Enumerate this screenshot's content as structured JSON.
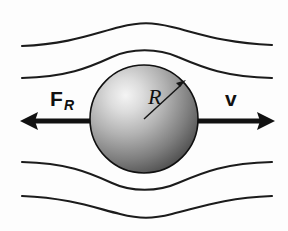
{
  "figure": {
    "background_color": "#fdfdfd",
    "width": 288,
    "height": 231
  },
  "labels": {
    "drag_force": {
      "name": "F",
      "subscript": "R",
      "full": "F_R",
      "x": 50,
      "y": 106,
      "color": "#111111"
    },
    "velocity": {
      "name": "v",
      "x": 225,
      "y": 106,
      "color": "#111111"
    },
    "radius": {
      "name": "R",
      "x": 148,
      "y": 104,
      "color": "#111111"
    }
  },
  "sphere": {
    "center_x": 144,
    "center_y": 119,
    "radius": 54,
    "highlight_x": 118,
    "highlight_y": 92,
    "highlight_color": "#f2f2f2",
    "mid_color": "#9a9a9a",
    "edge_color": "#3a3a3a",
    "outline_color": "#101010"
  },
  "vectors": [
    {
      "id": "drag-force-vector",
      "label": "F_R",
      "direction": "left",
      "tail_x": 144,
      "tail_y": 121,
      "tip_x": 20,
      "tip_y": 121,
      "color": "#111111"
    },
    {
      "id": "velocity-vector",
      "label": "v",
      "direction": "right",
      "tail_x": 144,
      "tail_y": 121,
      "tip_x": 275,
      "tip_y": 121,
      "color": "#111111"
    }
  ],
  "radius_arrow": {
    "id": "radius-arrow",
    "from_x": 144,
    "from_y": 119,
    "to_x": 185,
    "to_y": 81,
    "color": "#161616"
  },
  "streamlines": [
    {
      "id": "streamline-top-outer",
      "position": "top-outer",
      "path": "M 22 46 C 70 44 95 33 120 27 C 140 22 152 22 172 27 C 198 33 222 43 272 45",
      "color": "#1b1b1b",
      "width": 2.1
    },
    {
      "id": "streamline-top-inner",
      "position": "top-inner",
      "path": "M 22 78 C 66 77 88 68 112 57 C 131 48 158 48 178 57 C 204 68 226 77 272 78",
      "color": "#1b1b1b",
      "width": 2.1
    },
    {
      "id": "streamline-bottom-inner",
      "position": "bottom-inner",
      "path": "M 22 162 C 66 163 88 172 112 183 C 131 192 158 192 178 183 C 204 172 226 163 272 162",
      "color": "#1b1b1b",
      "width": 2.1
    },
    {
      "id": "streamline-bottom-outer",
      "position": "bottom-outer",
      "path": "M 22 196 C 70 198 95 208 120 214 C 140 219 152 219 172 214 C 198 208 222 198 272 196",
      "color": "#1b1b1b",
      "width": 2.1
    }
  ]
}
